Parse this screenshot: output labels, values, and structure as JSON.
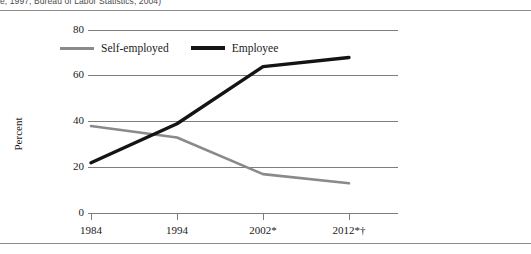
{
  "figure": {
    "source_note": "e, 1997; Bureau of Labor Statistics, 2004)"
  },
  "legend": {
    "items": [
      {
        "label": "Self-employed",
        "color": "#8a8a8a",
        "key": "self_employed"
      },
      {
        "label": "Employee",
        "color": "#141414",
        "key": "employee"
      }
    ]
  },
  "axes": {
    "y_title": "Percent",
    "y_ticks": [
      "0",
      "20",
      "40",
      "60",
      "80"
    ],
    "x_ticks": [
      "1984",
      "1994",
      "2002*",
      "2012*†"
    ]
  },
  "chart_data": {
    "type": "line",
    "title": "",
    "xlabel": "",
    "ylabel": "Percent",
    "categories": [
      "1984",
      "1994",
      "2002*",
      "2012*†"
    ],
    "series": [
      {
        "name": "Self-employed",
        "color": "#8a8a8a",
        "values": [
          38,
          33,
          17,
          13
        ]
      },
      {
        "name": "Employee",
        "color": "#141414",
        "values": [
          22,
          39,
          64,
          68
        ]
      }
    ],
    "ylim": [
      0,
      80
    ],
    "y_ticks": [
      0,
      20,
      40,
      60,
      80
    ],
    "grid": true,
    "legend_position": "top-left",
    "annotations": [
      "e, 1997; Bureau of Labor Statistics, 2004)"
    ]
  }
}
